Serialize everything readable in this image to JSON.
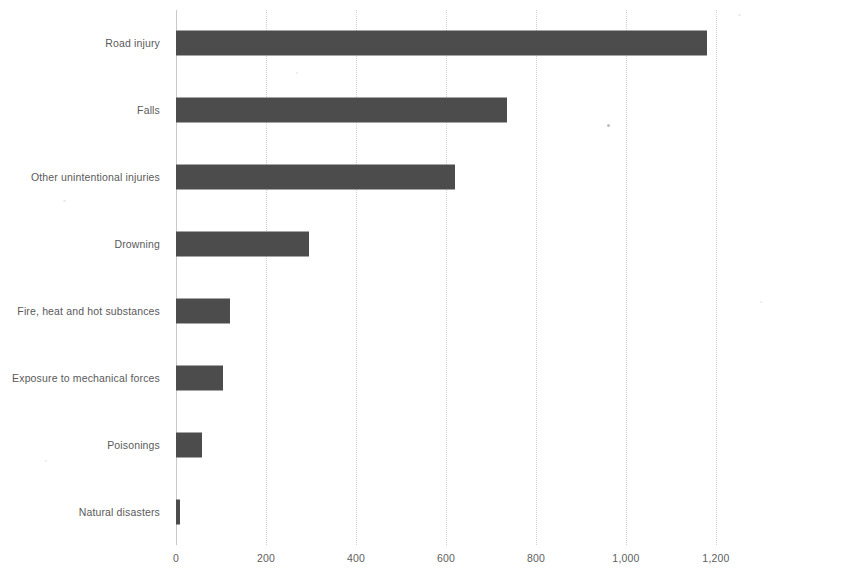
{
  "chart_data": {
    "type": "bar",
    "orientation": "horizontal",
    "title": "",
    "subtitle": "",
    "xlabel": "",
    "ylabel": "",
    "categories": [
      "Road injury",
      "Falls",
      "Other unintentional injuries",
      "Drowning",
      "Fire, heat and hot substances",
      "Exposure to mechanical forces",
      "Poisonings",
      "Natural disasters"
    ],
    "values": [
      1180,
      735,
      620,
      295,
      120,
      105,
      58,
      8
    ],
    "series": [
      {
        "name": "Deaths",
        "values": [
          1180,
          735,
          620,
          295,
          120,
          105,
          58,
          8
        ]
      }
    ],
    "xlim": [
      0,
      1200
    ],
    "xticks": [
      0,
      200,
      400,
      600,
      800,
      1000,
      1200
    ],
    "xtick_labels": [
      "0",
      "200",
      "400",
      "600",
      "800",
      "1,000",
      "1,200"
    ],
    "grid": true,
    "grid_axis": "x",
    "legend": false,
    "legend_position": "none",
    "bar_color": "#4c4c4c",
    "grid_color": "#d2d2d2",
    "axis_color": "#c9c9c9",
    "text_color": "#5a5a5a",
    "background_color": "#ffffff"
  }
}
